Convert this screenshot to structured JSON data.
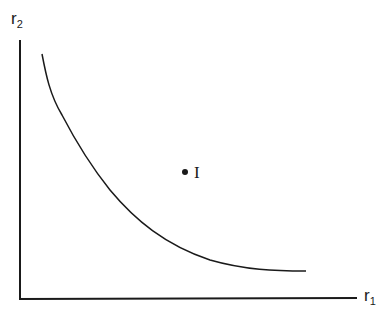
{
  "diagram": {
    "type": "indifference-curve",
    "axes": {
      "y": {
        "label_main": "r",
        "label_sub": "2"
      },
      "x": {
        "label_main": "r",
        "label_sub": "1"
      }
    },
    "curve": {
      "description": "convex downward-sloping curve",
      "points": [
        [
          42,
          54
        ],
        [
          50,
          88
        ],
        [
          62,
          115
        ],
        [
          80,
          148
        ],
        [
          100,
          180
        ],
        [
          130,
          212
        ],
        [
          170,
          240
        ],
        [
          220,
          262
        ],
        [
          265,
          270
        ],
        [
          306,
          271
        ]
      ]
    },
    "point": {
      "label": "I",
      "position": [
        185,
        172
      ]
    },
    "colors": {
      "line": "#1a1a1a",
      "background": "#ffffff"
    }
  }
}
